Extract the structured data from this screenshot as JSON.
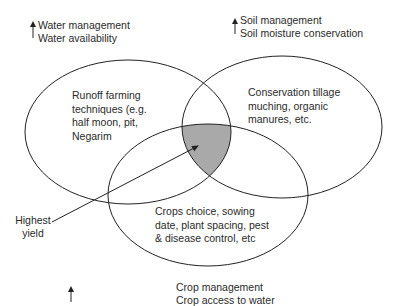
{
  "diagram": {
    "type": "venn",
    "colors": {
      "stroke": "#222222",
      "intersection_fill": "#a9a9a9",
      "background": "#ffffff"
    },
    "circles": [
      {
        "id": "water",
        "header": [
          "Water management",
          "Water availability"
        ],
        "content": [
          "Runoff farming",
          "techniques (e.g.",
          "half moon, pit,",
          "Negarim"
        ]
      },
      {
        "id": "soil",
        "header": [
          "Soil management",
          "Soil moisture conservation"
        ],
        "content": [
          "Conservation tillage",
          "muching, organic",
          "manures, etc."
        ]
      },
      {
        "id": "crop",
        "header": [
          "Crop management",
          "Crop access to water"
        ],
        "content": [
          "Crops choice, sowing",
          "date, plant spacing, pest",
          "& disease control, etc"
        ]
      }
    ],
    "intersection_label": [
      "Highest",
      "yield"
    ]
  }
}
